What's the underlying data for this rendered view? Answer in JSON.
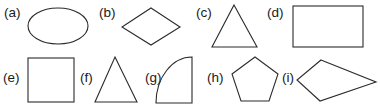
{
  "figure": {
    "background_color": "#ffffff",
    "stroke_color": "#2b2b2b",
    "label_color": "#1a1a1a",
    "width": 380,
    "height": 110,
    "rows": 2,
    "columns": 4
  },
  "shapes": [
    {
      "key": "a",
      "label": "(a)",
      "name": "ellipse",
      "label_x": 4,
      "label_y": 17,
      "geometry": {
        "type": "ellipse",
        "cx": 58,
        "cy": 26,
        "rx": 30,
        "ry": 18
      }
    },
    {
      "key": "b",
      "label": "(b)",
      "name": "rhombus",
      "label_x": 99,
      "label_y": 17,
      "geometry": {
        "type": "polygon",
        "points": "151,8 180,27 151,45 122,27"
      }
    },
    {
      "key": "c",
      "label": "(c)",
      "name": "triangle",
      "label_x": 196,
      "label_y": 17,
      "geometry": {
        "type": "polygon",
        "points": "234,5 257,47 212,47"
      }
    },
    {
      "key": "d",
      "label": "(d)",
      "name": "rectangle",
      "label_x": 267,
      "label_y": 17,
      "geometry": {
        "type": "rect",
        "x": 293,
        "y": 6,
        "width": 70,
        "height": 41
      }
    },
    {
      "key": "e",
      "label": "(e)",
      "name": "square",
      "label_x": 3,
      "label_y": 82,
      "geometry": {
        "type": "rect",
        "x": 28,
        "y": 58,
        "width": 46,
        "height": 44
      }
    },
    {
      "key": "f",
      "label": "(f)",
      "name": "triangle",
      "label_x": 80,
      "label_y": 82,
      "geometry": {
        "type": "polygon",
        "points": "115,57 137,102 95,102"
      }
    },
    {
      "key": "g",
      "label": "(g)",
      "name": "quarter-circle",
      "label_x": 145,
      "label_y": 82,
      "geometry": {
        "type": "path",
        "d": "M 192 57 A 36 46 0 0 0 156 103 L 192 103 Z"
      }
    },
    {
      "key": "h",
      "label": "(h)",
      "name": "pentagon",
      "label_x": 207,
      "label_y": 82,
      "geometry": {
        "type": "polygon",
        "points": "255,57 278,74 269,101 241,101 232,74"
      }
    },
    {
      "key": "i",
      "label": "(i)",
      "name": "kite-quadrilateral",
      "label_x": 282,
      "label_y": 82,
      "geometry": {
        "type": "polygon",
        "points": "321,60 376,82 320,101 297,80"
      }
    }
  ]
}
